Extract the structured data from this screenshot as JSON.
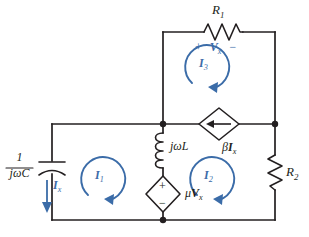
{
  "diagram": {
    "type": "electrical-circuit-schematic",
    "background_color": "#ffffff",
    "wire_color": "#231f20",
    "annotation_color": "#3b6ca8"
  },
  "components": {
    "capacitor": {
      "name": "capacitor",
      "label_numerator": "1",
      "label_denominator": "jωC",
      "position": "left-branch",
      "symbol": "curved-plate-capacitor"
    },
    "resistor_r1": {
      "name": "resistor-r1",
      "label_main": "R",
      "label_sub": "1",
      "position": "top-branch",
      "symbol": "zigzag-resistor-horizontal"
    },
    "resistor_r2": {
      "name": "resistor-r2",
      "label_main": "R",
      "label_sub": "2",
      "position": "right-branch",
      "symbol": "zigzag-resistor-vertical"
    },
    "inductor": {
      "name": "inductor",
      "label_main": "jωL",
      "position": "middle-vertical-branch",
      "symbol": "coil-inductor-vertical"
    },
    "dependent_current_source": {
      "name": "dependent-current-source",
      "label_coefficient": "β",
      "label_variable": "I",
      "label_sub": "x",
      "position": "middle-horizontal-branch",
      "symbol": "diamond-current-source",
      "arrow_direction": "left"
    },
    "dependent_voltage_source": {
      "name": "dependent-voltage-source",
      "label_coefficient": "μ",
      "label_variable": "V",
      "label_sub": "x",
      "position": "lower-middle-vertical-branch",
      "symbol": "diamond-voltage-source",
      "polarity_top": "+",
      "polarity_bottom": "−"
    }
  },
  "annotations": {
    "vx": {
      "name": "voltage-vx",
      "polarity_left": "+",
      "variable": "V",
      "sub": "x",
      "polarity_right": "−",
      "color": "#3b6ca8"
    },
    "ix": {
      "name": "current-ix",
      "variable": "I",
      "sub": "x",
      "direction": "down",
      "color": "#3b6ca8"
    }
  },
  "mesh_currents": [
    {
      "name": "mesh-current-i1",
      "variable": "I",
      "sub": "1",
      "direction": "clockwise",
      "color": "#3b6ca8"
    },
    {
      "name": "mesh-current-i2",
      "variable": "I",
      "sub": "2",
      "direction": "clockwise",
      "color": "#3b6ca8"
    },
    {
      "name": "mesh-current-i3",
      "variable": "I",
      "sub": "3",
      "direction": "clockwise",
      "color": "#3b6ca8"
    }
  ]
}
